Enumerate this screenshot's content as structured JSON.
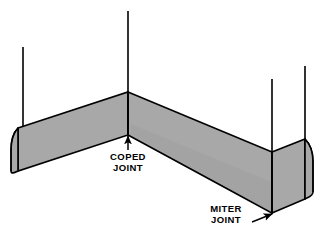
{
  "figure": {
    "type": "technical-line-illustration",
    "background_color": "#ffffff",
    "ink_color": "#000000",
    "baseboard_fill_color": "#a8a8a8",
    "baseboard_shadow_color": "#8f8f8f",
    "wall_texture": "stipple-speckle"
  },
  "annotations": [
    {
      "id": "coped",
      "name": "coped-joint",
      "lines": [
        "COPED",
        "JOINT"
      ],
      "text_x": 128,
      "text_y_first": 160,
      "line_height": 11,
      "leader": {
        "type": "arrow-up",
        "from_x": 128,
        "from_y": 150,
        "to_x": 128,
        "to_y": 134
      }
    },
    {
      "id": "miter",
      "name": "miter-joint",
      "lines": [
        "MITER",
        "JOINT"
      ],
      "text_x": 226,
      "text_y_first": 212,
      "line_height": 11,
      "leader": {
        "type": "arrow-right",
        "from_x": 253,
        "from_y": 222,
        "to_x": 274,
        "to_y": 214
      }
    }
  ],
  "geometry": {
    "walls": {
      "left_wall_edge": {
        "x": 23,
        "y_top": 47,
        "y_bottom": 129
      },
      "inside_corner_edge": {
        "x": 128,
        "y_top": 11,
        "y_bottom": 92
      },
      "outside_corner_edge": {
        "x": 272,
        "y_top": 79,
        "y_bottom": 152
      },
      "right_wall_edge": {
        "x": 305,
        "y_top": 66,
        "y_bottom": 160
      }
    },
    "baseboard": {
      "left_end_x": 18,
      "left_top_y": 128,
      "inside_corner_x": 128,
      "inside_corner_top_y": 92,
      "inside_corner_bottom_y": 135,
      "outside_corner_x": 272,
      "outside_corner_top_y": 152,
      "outside_corner_bottom_y": 213,
      "right_return_x": 305,
      "height_px": 44
    }
  }
}
